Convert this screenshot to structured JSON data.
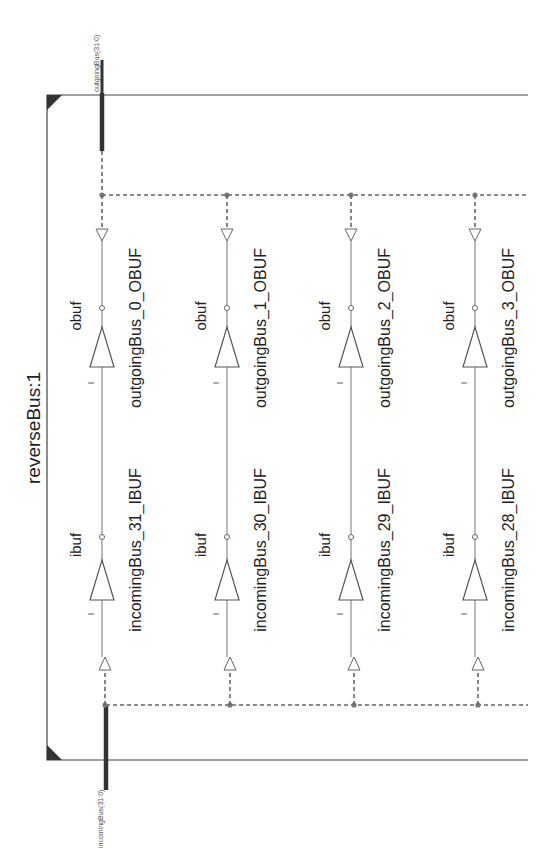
{
  "module": {
    "title": "reverseBus:1"
  },
  "ports": {
    "output": "outgoingBus(31:0)",
    "input": "incomingBus(31:0)"
  },
  "rows": [
    {
      "ibuf": {
        "type": "ibuf",
        "instance": "incomingBus_31_IBUF",
        "in_pin": "I",
        "out_pin": "O"
      },
      "obuf": {
        "type": "obuf",
        "instance": "outgoingBus_0_OBUF",
        "in_pin": "I",
        "out_pin": "O"
      }
    },
    {
      "ibuf": {
        "type": "ibuf",
        "instance": "incomingBus_30_IBUF",
        "in_pin": "I",
        "out_pin": "O"
      },
      "obuf": {
        "type": "obuf",
        "instance": "outgoingBus_1_OBUF",
        "in_pin": "I",
        "out_pin": "O"
      }
    },
    {
      "ibuf": {
        "type": "ibuf",
        "instance": "incomingBus_29_IBUF",
        "in_pin": "I",
        "out_pin": "O"
      },
      "obuf": {
        "type": "obuf",
        "instance": "outgoingBus_2_OBUF",
        "in_pin": "I",
        "out_pin": "O"
      }
    },
    {
      "ibuf": {
        "type": "ibuf",
        "instance": "incomingBus_28_IBUF",
        "in_pin": "I",
        "out_pin": "O"
      },
      "obuf": {
        "type": "obuf",
        "instance": "outgoingBus_3_OBUF",
        "in_pin": "I",
        "out_pin": "O"
      }
    }
  ]
}
